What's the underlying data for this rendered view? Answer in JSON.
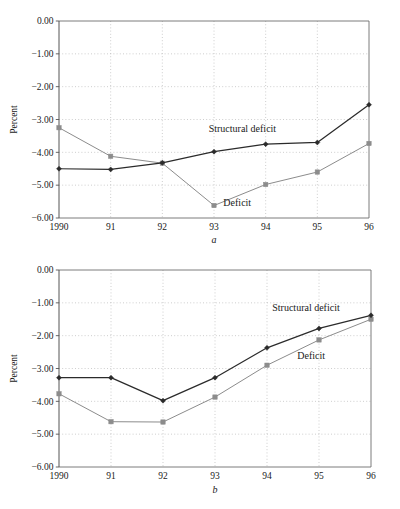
{
  "figure": {
    "panels": [
      "a",
      "b"
    ]
  },
  "chart_data": [
    {
      "type": "line",
      "panel": "a",
      "title": "",
      "caption": "a",
      "xlabel": "",
      "ylabel": "Percent",
      "grid": true,
      "legend": "inline-annotations",
      "categories": [
        "1990",
        "91",
        "92",
        "93",
        "94",
        "95",
        "96"
      ],
      "x": [
        1990,
        1991,
        1992,
        1993,
        1994,
        1995,
        1996
      ],
      "ylim": [
        -6.0,
        0.0
      ],
      "yticks": [
        0.0,
        -1.0,
        -2.0,
        -3.0,
        -4.0,
        -5.0,
        -6.0
      ],
      "yticklabels": [
        "0.00",
        "-1.00",
        "-2.00",
        "-3.00",
        "-4.00",
        "-5.00",
        "-6.00"
      ],
      "series": [
        {
          "name": "Structural deficit",
          "marker": "diamond",
          "color": "#2b2b2b",
          "label_x_value": 1993.55,
          "label_y_value": -3.37,
          "values": [
            -4.5,
            -4.52,
            -4.32,
            -3.98,
            -3.75,
            -3.7,
            -2.55
          ]
        },
        {
          "name": "Deficit",
          "marker": "square",
          "color": "#8c8c8c",
          "label_x_value": 1993.45,
          "label_y_value": -5.62,
          "values": [
            -3.25,
            -4.12,
            -4.33,
            -5.62,
            -4.98,
            -4.6,
            -3.73
          ]
        }
      ]
    },
    {
      "type": "line",
      "panel": "b",
      "title": "",
      "caption": "b",
      "xlabel": "",
      "ylabel": "Percent",
      "grid": true,
      "legend": "inline-annotations",
      "categories": [
        "1990",
        "91",
        "92",
        "93",
        "94",
        "95",
        "96"
      ],
      "x": [
        1990,
        1991,
        1992,
        1993,
        1994,
        1995,
        1996
      ],
      "ylim": [
        -6.0,
        0.0
      ],
      "yticks": [
        0.0,
        -1.0,
        -2.0,
        -3.0,
        -4.0,
        -5.0,
        -6.0
      ],
      "yticklabels": [
        "0.00",
        "-1.00",
        "-2.00",
        "-3.00",
        "-4.00",
        "-5.00",
        "-6.00"
      ],
      "series": [
        {
          "name": "Structural deficit",
          "marker": "diamond",
          "color": "#2b2b2b",
          "label_x_value": 1994.75,
          "label_y_value": -1.25,
          "values": [
            -3.28,
            -3.28,
            -3.98,
            -3.28,
            -2.37,
            -1.78,
            -1.38
          ]
        },
        {
          "name": "Deficit",
          "marker": "square",
          "color": "#8c8c8c",
          "label_x_value": 1994.85,
          "label_y_value": -2.7,
          "values": [
            -3.77,
            -4.62,
            -4.63,
            -3.87,
            -2.9,
            -2.13,
            -1.5
          ]
        }
      ]
    }
  ],
  "style": {
    "structural_color": "#2b2b2b",
    "deficit_color": "#8c8c8c",
    "grid_color": "#b9b9b9",
    "frame_color": "#6d6d6d",
    "background": "#ffffff"
  }
}
